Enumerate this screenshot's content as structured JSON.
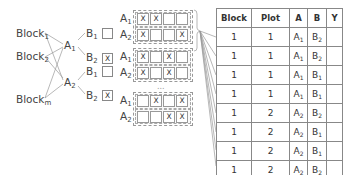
{
  "tree": {
    "blocks": [
      {
        "base": "Block",
        "sub": "1"
      },
      {
        "base": "Block",
        "sub": "2"
      },
      {
        "base": "Block",
        "sub": "m"
      }
    ],
    "a_levels": [
      {
        "base": "A",
        "sub": "1"
      },
      {
        "base": "A",
        "sub": "2"
      }
    ],
    "b_levels": [
      {
        "base": "B",
        "sub": "1",
        "mark": ""
      },
      {
        "base": "B",
        "sub": "2",
        "mark": "X"
      },
      {
        "base": "B",
        "sub": "1",
        "mark": ""
      },
      {
        "base": "B",
        "sub": "2",
        "mark": "X"
      }
    ]
  },
  "plots": [
    {
      "rows": [
        {
          "label": {
            "base": "A",
            "sub": "1"
          },
          "cells": [
            "X",
            "X",
            "",
            ""
          ]
        },
        {
          "label": {
            "base": "A",
            "sub": "2"
          },
          "cells": [
            "X",
            "",
            "",
            "X"
          ]
        }
      ]
    },
    {
      "rows": [
        {
          "label": {
            "base": "A",
            "sub": "1"
          },
          "cells": [
            "X",
            "",
            "X",
            ""
          ]
        },
        {
          "label": {
            "base": "A",
            "sub": "2"
          },
          "cells": [
            "X",
            "",
            "X",
            ""
          ]
        }
      ]
    },
    {
      "rows": [
        {
          "label": {
            "base": "A",
            "sub": "1"
          },
          "cells": [
            "",
            "X",
            "",
            "X"
          ]
        },
        {
          "label": {
            "base": "A",
            "sub": "2"
          },
          "cells": [
            "",
            "",
            "X",
            "X"
          ]
        }
      ]
    }
  ],
  "ellipsis": "...",
  "table": {
    "headers": [
      "Block",
      "Plot",
      "A",
      "B",
      "Y"
    ],
    "rows": [
      {
        "block": "1",
        "plot": "1",
        "a": "A",
        "a_sub": "1",
        "b": "B",
        "b_sub": "2",
        "y": ""
      },
      {
        "block": "1",
        "plot": "1",
        "a": "A",
        "a_sub": "1",
        "b": "B",
        "b_sub": "2",
        "y": ""
      },
      {
        "block": "1",
        "plot": "1",
        "a": "A",
        "a_sub": "1",
        "b": "B",
        "b_sub": "1",
        "y": ""
      },
      {
        "block": "1",
        "plot": "1",
        "a": "A",
        "a_sub": "1",
        "b": "B",
        "b_sub": "1",
        "y": ""
      },
      {
        "block": "1",
        "plot": "2",
        "a": "A",
        "a_sub": "2",
        "b": "B",
        "b_sub": "2",
        "y": ""
      },
      {
        "block": "1",
        "plot": "2",
        "a": "A",
        "a_sub": "2",
        "b": "B",
        "b_sub": "1",
        "y": ""
      },
      {
        "block": "1",
        "plot": "2",
        "a": "A",
        "a_sub": "2",
        "b": "B",
        "b_sub": "1",
        "y": ""
      },
      {
        "block": "1",
        "plot": "2",
        "a": "A",
        "a_sub": "2",
        "b": "B",
        "b_sub": "2",
        "y": ""
      }
    ]
  }
}
